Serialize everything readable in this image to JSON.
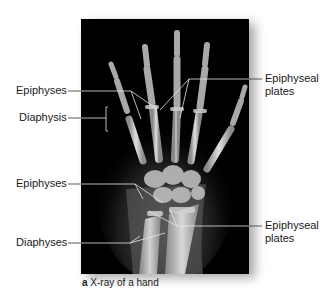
{
  "figure": {
    "caption_letter": "a",
    "caption_text": "X-ray of a hand"
  },
  "labels": {
    "left": [
      {
        "id": "epiphyses_upper",
        "text": "Epiphyses"
      },
      {
        "id": "diaphysis",
        "text": "Diaphysis"
      },
      {
        "id": "epiphyses_lower",
        "text": "Epiphyses"
      },
      {
        "id": "diaphyses",
        "text": "Diaphyses"
      }
    ],
    "right": [
      {
        "id": "epiphyseal_plates_upper",
        "line1": "Epiphyseal",
        "line2": "plates"
      },
      {
        "id": "epiphyseal_plates_lower",
        "line1": "Epiphyseal",
        "line2": "plates"
      }
    ]
  },
  "colors": {
    "background": "#ffffff",
    "xray_background": "#000000",
    "bone": "#d8d8d8",
    "leader_line_on_image": "#e6e6e6",
    "leader_line_outside": "#333333",
    "text": "#1a1a1a"
  }
}
